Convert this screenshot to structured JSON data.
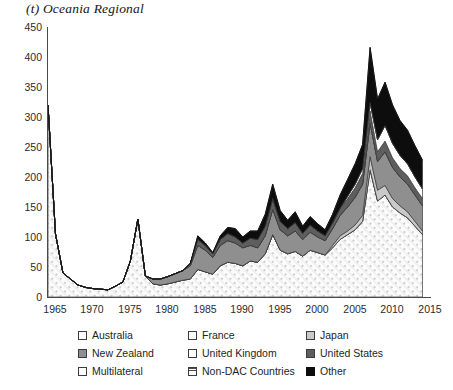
{
  "chart_title": "(t) Oceania Regional",
  "axes": {
    "y_ticks": [
      "0",
      "50",
      "100",
      "150",
      "200",
      "250",
      "300",
      "350",
      "400",
      "450"
    ],
    "x_ticks": [
      "1965",
      "1970",
      "1975",
      "1980",
      "1985",
      "1990",
      "1995",
      "2000",
      "2005",
      "2010",
      "2015"
    ]
  },
  "legend": {
    "items": [
      {
        "label": "Australia",
        "swatch": "australia-swatch",
        "color": "#fdfdfd"
      },
      {
        "label": "France",
        "swatch": "france-swatch",
        "color": "#ffffff"
      },
      {
        "label": "Japan",
        "swatch": "japan-swatch",
        "color": "#c9c9c9"
      },
      {
        "label": "New Zealand",
        "swatch": "new-zealand-swatch",
        "color": "#8f8f8f"
      },
      {
        "label": "United Kingdom",
        "swatch": "united-kingdom-swatch",
        "color": "#ffffff"
      },
      {
        "label": "United States",
        "swatch": "united-states-swatch",
        "color": "#5e5e5e"
      },
      {
        "label": "Multilateral",
        "swatch": "multilateral-swatch",
        "color": "#ffffff"
      },
      {
        "label": "Non-DAC Countries",
        "swatch": "non-dac-swatch",
        "color": "#ffffff"
      },
      {
        "label": "Other",
        "swatch": "other-swatch",
        "color": "#0d0d0d"
      }
    ]
  },
  "chart_data": {
    "type": "area",
    "stacked": true,
    "title": "(t) Oceania Regional",
    "xlabel": "",
    "ylabel": "",
    "ylim": [
      0,
      450
    ],
    "xlim": [
      1965,
      2016
    ],
    "grid": false,
    "legend_position": "bottom",
    "x": [
      1965,
      1966,
      1967,
      1968,
      1969,
      1970,
      1971,
      1972,
      1973,
      1974,
      1975,
      1976,
      1977,
      1978,
      1979,
      1980,
      1981,
      1982,
      1983,
      1984,
      1985,
      1986,
      1987,
      1988,
      1989,
      1990,
      1991,
      1992,
      1993,
      1994,
      1995,
      1996,
      1997,
      1998,
      1999,
      2000,
      2001,
      2002,
      2003,
      2004,
      2005,
      2006,
      2007,
      2008,
      2009,
      2010,
      2011,
      2012,
      2013,
      2014,
      2015
    ],
    "series": [
      {
        "name": "Australia",
        "values": [
          320,
          105,
          40,
          30,
          20,
          16,
          14,
          13,
          12,
          18,
          25,
          60,
          130,
          35,
          22,
          20,
          22,
          25,
          28,
          30,
          46,
          42,
          38,
          52,
          58,
          56,
          52,
          60,
          58,
          72,
          104,
          78,
          72,
          76,
          68,
          78,
          74,
          70,
          82,
          96,
          104,
          112,
          126,
          212,
          160,
          170,
          150,
          140,
          132,
          118,
          104
        ]
      },
      {
        "name": "France",
        "values": [
          0,
          0,
          0,
          0,
          0,
          0,
          0,
          0,
          0,
          0,
          0,
          0,
          0,
          0,
          0,
          0,
          0,
          0,
          0,
          0,
          0,
          0,
          0,
          0,
          0,
          0,
          0,
          0,
          0,
          0,
          0,
          0,
          0,
          0,
          0,
          0,
          0,
          0,
          0,
          0,
          0,
          0,
          0,
          0,
          0,
          0,
          0,
          0,
          0,
          0,
          0
        ]
      },
      {
        "name": "Japan",
        "values": [
          0,
          0,
          0,
          0,
          0,
          0,
          0,
          0,
          0,
          0,
          0,
          0,
          0,
          0,
          0,
          0,
          0,
          0,
          0,
          0,
          0,
          0,
          0,
          0,
          0,
          0,
          0,
          0,
          0,
          0,
          0,
          0,
          0,
          0,
          0,
          0,
          0,
          0,
          4,
          6,
          6,
          8,
          10,
          22,
          18,
          16,
          14,
          12,
          10,
          8,
          6
        ]
      },
      {
        "name": "New Zealand",
        "values": [
          0,
          0,
          0,
          0,
          0,
          0,
          0,
          0,
          0,
          0,
          0,
          0,
          0,
          0,
          8,
          10,
          12,
          14,
          16,
          22,
          40,
          36,
          28,
          34,
          36,
          34,
          30,
          26,
          24,
          30,
          42,
          34,
          30,
          34,
          28,
          30,
          26,
          24,
          28,
          34,
          40,
          46,
          52,
          56,
          48,
          56,
          52,
          48,
          46,
          44,
          42
        ]
      },
      {
        "name": "United Kingdom",
        "values": [
          0,
          0,
          0,
          0,
          0,
          0,
          0,
          0,
          0,
          0,
          0,
          0,
          0,
          0,
          0,
          0,
          0,
          0,
          0,
          0,
          0,
          0,
          0,
          0,
          0,
          0,
          0,
          0,
          0,
          0,
          0,
          0,
          0,
          0,
          0,
          0,
          0,
          0,
          0,
          0,
          0,
          0,
          0,
          0,
          0,
          0,
          0,
          0,
          0,
          0,
          0
        ]
      },
      {
        "name": "United States",
        "values": [
          0,
          0,
          0,
          0,
          0,
          0,
          0,
          0,
          0,
          0,
          0,
          0,
          0,
          0,
          0,
          0,
          0,
          0,
          0,
          4,
          10,
          8,
          6,
          10,
          12,
          10,
          8,
          12,
          14,
          16,
          18,
          14,
          12,
          14,
          10,
          12,
          10,
          8,
          10,
          12,
          14,
          16,
          18,
          20,
          16,
          18,
          16,
          14,
          14,
          12,
          12
        ]
      },
      {
        "name": "Multilateral",
        "values": [
          0,
          0,
          0,
          0,
          0,
          0,
          0,
          0,
          0,
          0,
          0,
          0,
          0,
          0,
          0,
          0,
          0,
          0,
          0,
          0,
          0,
          0,
          0,
          0,
          0,
          0,
          0,
          0,
          0,
          0,
          0,
          0,
          0,
          0,
          0,
          0,
          0,
          0,
          0,
          0,
          4,
          6,
          8,
          14,
          20,
          26,
          24,
          22,
          20,
          18,
          16
        ]
      },
      {
        "name": "Non-DAC Countries",
        "values": [
          0,
          0,
          0,
          0,
          0,
          0,
          0,
          0,
          0,
          0,
          0,
          0,
          0,
          0,
          0,
          0,
          0,
          0,
          0,
          0,
          0,
          0,
          0,
          0,
          0,
          0,
          0,
          0,
          0,
          0,
          0,
          0,
          0,
          0,
          0,
          0,
          0,
          0,
          0,
          0,
          0,
          0,
          0,
          0,
          0,
          0,
          0,
          0,
          0,
          0,
          0
        ]
      },
      {
        "name": "Other",
        "values": [
          0,
          0,
          0,
          0,
          0,
          0,
          0,
          0,
          0,
          0,
          0,
          0,
          0,
          0,
          0,
          0,
          0,
          0,
          0,
          0,
          6,
          4,
          2,
          6,
          10,
          14,
          10,
          12,
          14,
          20,
          24,
          18,
          14,
          18,
          12,
          14,
          12,
          10,
          14,
          22,
          28,
          34,
          40,
          92,
          68,
          72,
          64,
          58,
          56,
          52,
          48
        ]
      }
    ],
    "totals": [
      320,
      105,
      40,
      30,
      20,
      16,
      14,
      13,
      12,
      18,
      25,
      60,
      130,
      35,
      30,
      30,
      34,
      39,
      44,
      56,
      102,
      90,
      74,
      102,
      116,
      114,
      100,
      110,
      110,
      138,
      188,
      144,
      128,
      142,
      118,
      134,
      122,
      112,
      138,
      170,
      196,
      222,
      254,
      416,
      330,
      358,
      320,
      294,
      278,
      252,
      228
    ]
  }
}
